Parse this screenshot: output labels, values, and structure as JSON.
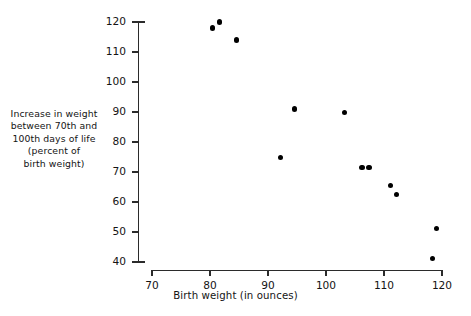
{
  "chart_data": {
    "type": "scatter",
    "title": "",
    "xlabel": "Birth weight (in ounces)",
    "ylabel": "Increase in  weight between 70th and 100th days of life (percent of birth weight)",
    "ylabel_lines": [
      "Increase in  weight",
      "between 70th and",
      "100th days of life",
      "(percent of",
      "birth weight)"
    ],
    "xlim": [
      70,
      120
    ],
    "ylim": [
      40,
      120
    ],
    "xticks": [
      70,
      80,
      90,
      100,
      110,
      120
    ],
    "yticks": [
      40,
      50,
      60,
      70,
      80,
      90,
      100,
      110,
      120
    ],
    "xtick_labels": [
      "70",
      "80",
      "90",
      "100",
      "110",
      "120"
    ],
    "ytick_labels": [
      "40",
      "50",
      "60",
      "70",
      "80",
      "90",
      "100",
      "110",
      "120"
    ],
    "grid": false,
    "legend": null,
    "marker": "filled-circle",
    "marker_color": "#000000",
    "axis_color": "#2b2b2b",
    "points": [
      {
        "x": 80.5,
        "y": 118.0
      },
      {
        "x": 81.6,
        "y": 120.0
      },
      {
        "x": 84.6,
        "y": 114.0
      },
      {
        "x": 92.2,
        "y": 74.8
      },
      {
        "x": 94.5,
        "y": 91.0
      },
      {
        "x": 103.2,
        "y": 89.8
      },
      {
        "x": 106.2,
        "y": 71.5
      },
      {
        "x": 107.4,
        "y": 71.5
      },
      {
        "x": 111.1,
        "y": 65.5
      },
      {
        "x": 112.1,
        "y": 62.5
      },
      {
        "x": 118.3,
        "y": 41.3
      },
      {
        "x": 119.1,
        "y": 51.3
      }
    ]
  }
}
